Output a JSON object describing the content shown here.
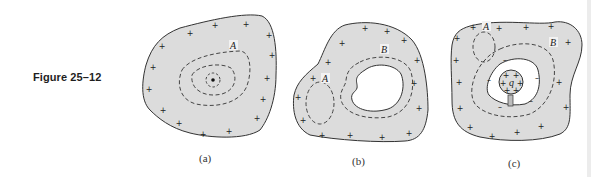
{
  "figure": {
    "label": "Figure 25–12",
    "panels": [
      {
        "id": "a",
        "caption": "(a)",
        "labels": {
          "surface": "A"
        },
        "description": "Solid conductor with surface charges (+) and dashed Gaussian surfaces around an interior point"
      },
      {
        "id": "b",
        "caption": "(b)",
        "labels": {
          "surface1": "A",
          "surface2": "B"
        },
        "description": "Conductor with empty cavity; Gaussian surface A inside conductor, B surrounding cavity"
      },
      {
        "id": "c",
        "caption": "(c)",
        "labels": {
          "surface1": "A",
          "surface2": "B",
          "charge": "q"
        },
        "description": "Conductor with cavity containing insulated charge q; induced negative charge on cavity wall"
      }
    ],
    "symbols": {
      "plus": "+",
      "minus": "–"
    }
  }
}
